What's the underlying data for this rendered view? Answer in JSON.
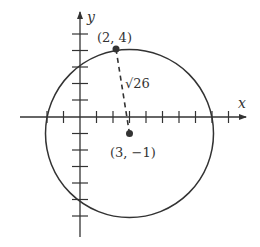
{
  "diagram": {
    "axes": {
      "x_label": "x",
      "y_label": "y"
    },
    "circle": {
      "center": [
        3,
        -1
      ],
      "radius_label": "√26"
    },
    "points": [
      {
        "label": "(2, 4)",
        "coords": [
          2,
          4
        ]
      },
      {
        "label": "(3, −1)",
        "coords": [
          3,
          -1
        ]
      }
    ],
    "colors": {
      "stroke": "#333333",
      "background": "#ffffff"
    }
  }
}
